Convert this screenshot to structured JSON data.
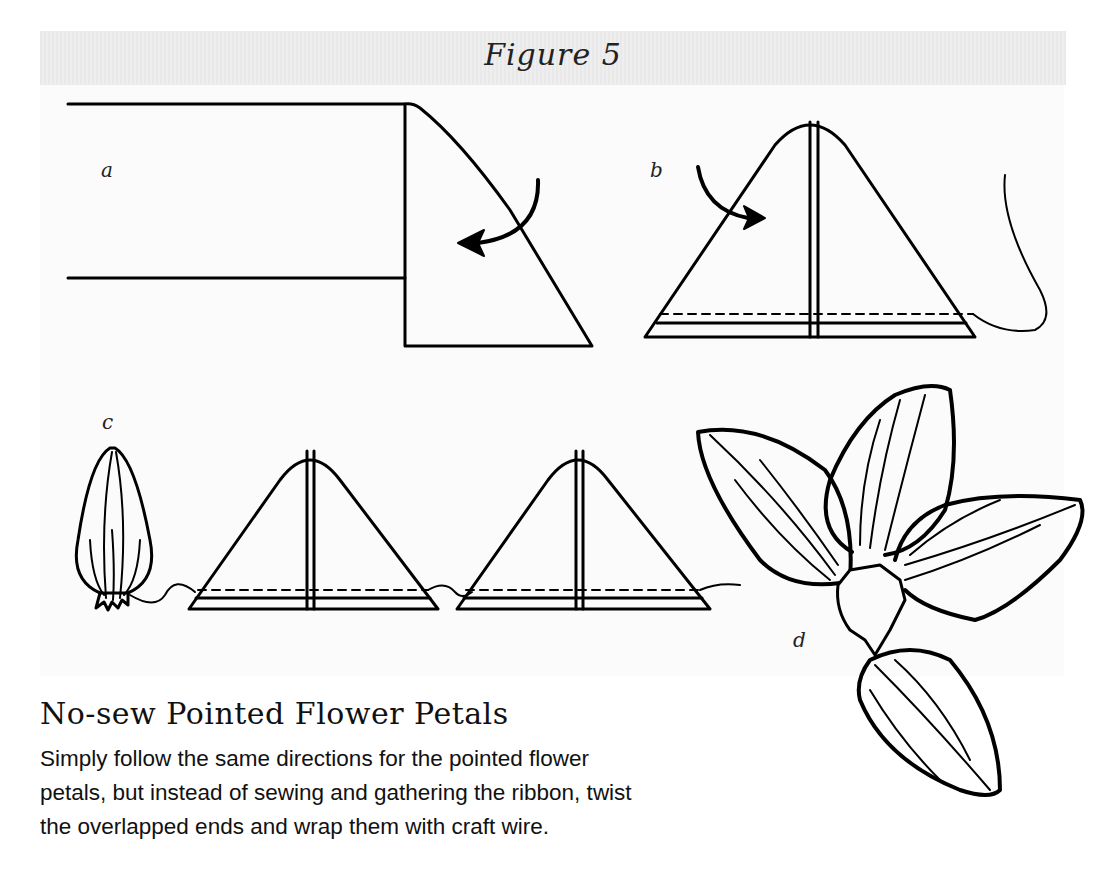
{
  "figure": {
    "title": "Figure 5",
    "background_color": "#fbfbfb",
    "header_band_color": "#ebebeb",
    "line_color": "#000000",
    "steps": [
      {
        "label": "a",
        "description": "ribbon end folded down diagonally with curved arrow"
      },
      {
        "label": "b",
        "description": "folded ribbon forming triangle with stitching line and thread"
      },
      {
        "label": "c",
        "description": "gathered pointed petal followed by two triangles strung on thread"
      },
      {
        "label": "d",
        "description": "five pointed petals joined into flower"
      }
    ]
  },
  "article": {
    "heading": "No-sew Pointed Flower Petals",
    "body_lines": [
      "Simply follow the same directions for the pointed flower",
      "petals, but instead of sewing and gathering the ribbon, twist",
      "the overlapped ends and wrap them with craft wire."
    ]
  }
}
